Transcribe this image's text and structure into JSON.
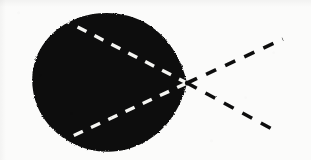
{
  "figure": {
    "canvas": {
      "width": 311,
      "height": 160
    },
    "colors": {
      "background": "#fbfbfa",
      "ink": "#0d0d0d",
      "blob_fill": "#0a0a0a",
      "ray_light": "#f5f5f2"
    }
  },
  "chart_data": {
    "type": "scatter",
    "xlabel": "",
    "ylabel": "",
    "xlim": [
      0,
      311
    ],
    "ylim": [
      0,
      160
    ],
    "grid": false,
    "legend": "none",
    "focal_point": {
      "x": 187,
      "y": 83,
      "label": "apex"
    },
    "blob": {
      "shape": "teardrop",
      "left_edge_x": 33,
      "right_tip_x": 187,
      "top_edge_y": 13,
      "bottom_edge_y": 150,
      "center": {
        "x": 105,
        "y": 82
      },
      "radius_x": 72,
      "radius_y": 69
    },
    "axis_line": {
      "style": "solid",
      "from": {
        "x": 0,
        "y": 83
      },
      "to": {
        "x": 35,
        "y": 83
      },
      "color": "#0d0d0d",
      "width": 2.4
    },
    "series": [
      {
        "name": "incoming-ray-upper",
        "style": "dashed",
        "color": "#f5f5f2",
        "region": "inside-blob",
        "points": [
          {
            "x": 66,
            "y": 21
          },
          {
            "x": 187,
            "y": 83
          }
        ]
      },
      {
        "name": "incoming-ray-axis",
        "style": "dashed",
        "color": "#f5f5f2",
        "region": "inside-blob",
        "points": [
          {
            "x": 35,
            "y": 83
          },
          {
            "x": 187,
            "y": 83
          }
        ]
      },
      {
        "name": "incoming-ray-lower",
        "style": "dashed",
        "color": "#f5f5f2",
        "region": "inside-blob",
        "points": [
          {
            "x": 62,
            "y": 141
          },
          {
            "x": 187,
            "y": 83
          }
        ]
      },
      {
        "name": "outgoing-ray-upper",
        "style": "dashed",
        "color": "#0d0d0d",
        "region": "outside-blob",
        "points": [
          {
            "x": 187,
            "y": 83
          },
          {
            "x": 281,
            "y": 40
          }
        ]
      },
      {
        "name": "outgoing-ray-axis",
        "style": "dashed",
        "color": "#0d0d0d",
        "region": "outside-blob",
        "points": [
          {
            "x": 187,
            "y": 83
          },
          {
            "x": 311,
            "y": 83
          }
        ]
      },
      {
        "name": "outgoing-ray-lower",
        "style": "dashed",
        "color": "#0d0d0d",
        "region": "outside-blob",
        "points": [
          {
            "x": 187,
            "y": 83
          },
          {
            "x": 272,
            "y": 129
          }
        ]
      }
    ]
  }
}
